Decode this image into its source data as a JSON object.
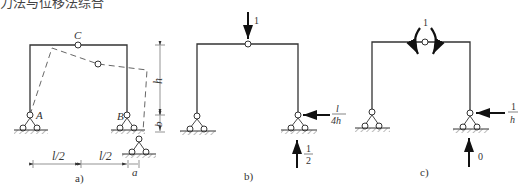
{
  "caption_top": "力法与位移法综合",
  "panel_a": {
    "label": "a)",
    "hinge_top": "C",
    "support_left": "A",
    "support_right": "B",
    "dim_height": "h",
    "dim_settle": "b",
    "dim_span_left": "l/2",
    "dim_span_right": "l/2",
    "dim_shift": "a"
  },
  "panel_b": {
    "label": "b)",
    "load": "1",
    "h_reaction_num": "l",
    "h_reaction_den": "4h",
    "v_reaction_num": "1",
    "v_reaction_den": "2"
  },
  "panel_c": {
    "label": "c)",
    "moment": "1",
    "h_reaction_num": "1",
    "h_reaction_den": "h",
    "v_reaction": "0"
  }
}
